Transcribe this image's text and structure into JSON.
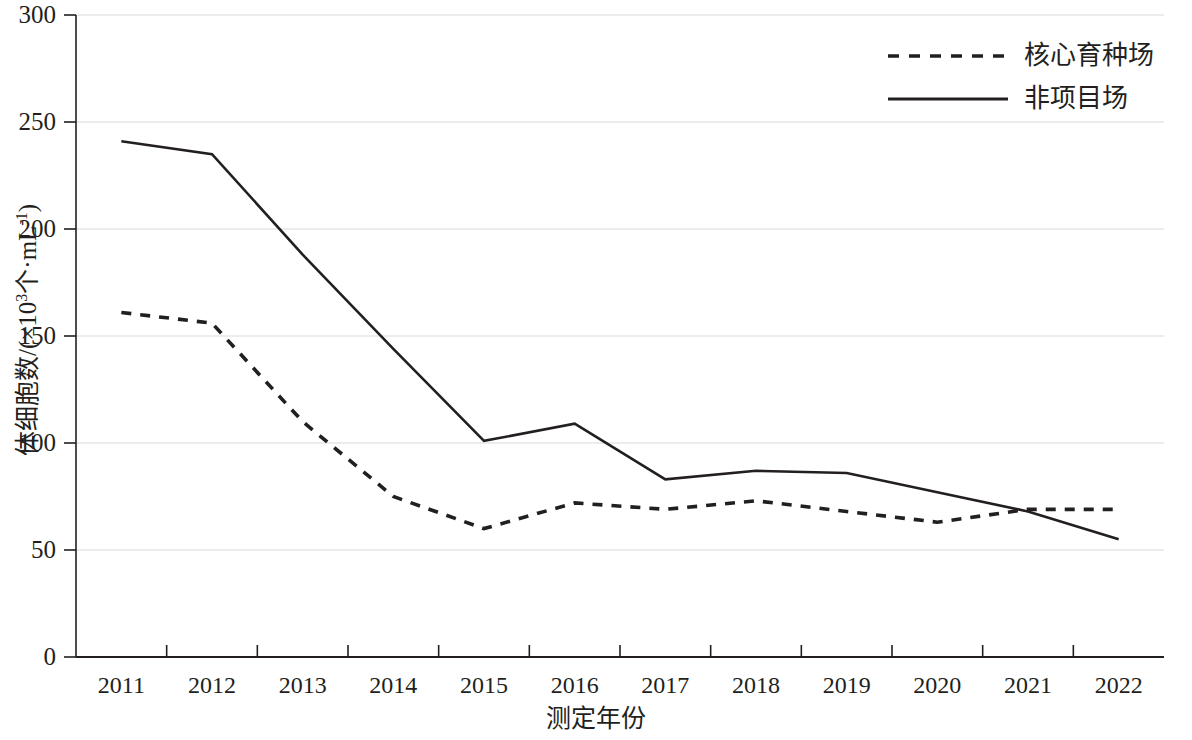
{
  "chart_data": {
    "type": "line",
    "title": "",
    "xlabel": "测定年份",
    "ylabel_parts": {
      "pre": "体细胞数/(×10",
      "exp": "3",
      "post": "个·mL",
      "exp2": "-1",
      "tail": ")"
    },
    "ylabel": "体细胞数/(×10³个·mL⁻¹)",
    "categories": [
      "2011",
      "2012",
      "2013",
      "2014",
      "2015",
      "2016",
      "2017",
      "2018",
      "2019",
      "2020",
      "2021",
      "2022"
    ],
    "x": [
      2011,
      2012,
      2013,
      2014,
      2015,
      2016,
      2017,
      2018,
      2019,
      2020,
      2021,
      2022
    ],
    "series": [
      {
        "name": "核心育种场",
        "style": "dashed",
        "color": "#231f20",
        "values": [
          161,
          156,
          110,
          75,
          60,
          72,
          69,
          73,
          68,
          63,
          69,
          69
        ]
      },
      {
        "name": "非项目场",
        "style": "solid",
        "color": "#231f20",
        "values": [
          241,
          235,
          188,
          144,
          101,
          109,
          83,
          87,
          86,
          77,
          68,
          55
        ]
      }
    ],
    "ylim": [
      0,
      300
    ],
    "yticks": [
      0,
      50,
      100,
      150,
      200,
      250,
      300
    ],
    "ytick_labels": [
      "0",
      "50",
      "100",
      "150",
      "200",
      "250",
      "300"
    ],
    "grid": true,
    "grid_axis": "y",
    "legend_position": "top-right"
  },
  "legend": {
    "items": [
      {
        "label": "核心育种场",
        "style": "dashed"
      },
      {
        "label": "非项目场",
        "style": "solid"
      }
    ]
  },
  "axes": {
    "x_title": "测定年份",
    "y_title": "体细胞数/(×10³个·mL⁻¹)"
  },
  "colors": {
    "line": "#231f20",
    "grid": "#d9d9d9",
    "axis": "#231f20",
    "background": "#ffffff"
  }
}
